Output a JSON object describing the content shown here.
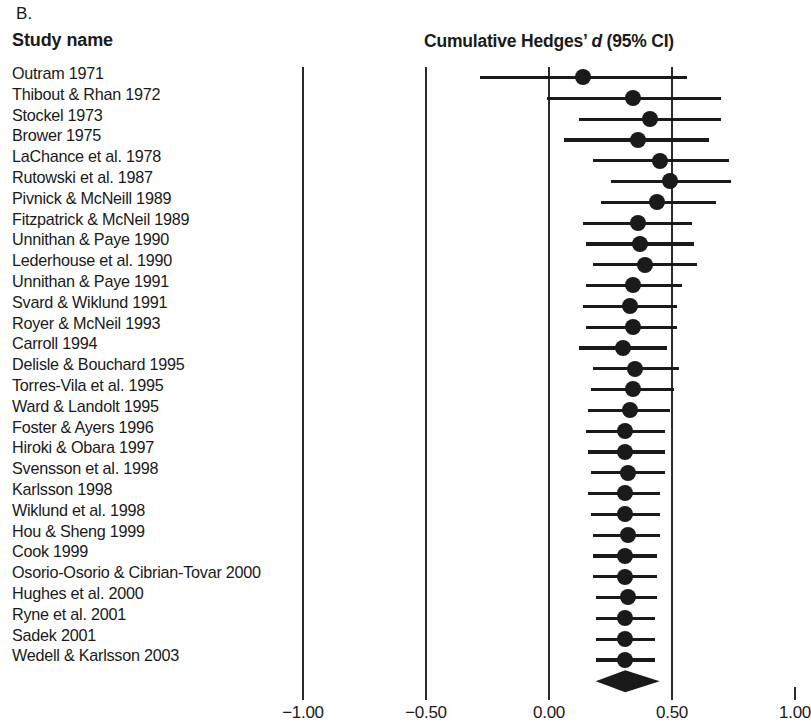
{
  "panel_label": "B.",
  "study_name_header": "Study name",
  "plot_title": {
    "prefix": "Cumulative Hedges’ ",
    "italic": "d",
    "suffix": " (95% CI)"
  },
  "axis": {
    "ticks": [
      "−1.00",
      "−0.50",
      "0.00",
      "0.50",
      "1.00"
    ],
    "tick_values": [
      -1.0,
      -0.5,
      0.0,
      0.5,
      1.0
    ],
    "gridline_values": [
      -1.0,
      -0.5,
      0.0,
      0.5
    ]
  },
  "chart_data": {
    "type": "forest",
    "title": "Cumulative Hedges’ d (95% CI)",
    "xlabel": "",
    "ylabel": "Study name",
    "xlim": [
      -1.2,
      1.05
    ],
    "grid": true,
    "legend": "none",
    "categories": [
      "Outram 1971",
      "Thibout & Rhan 1972",
      "Stockel 1973",
      "Brower 1975",
      "LaChance et al. 1978",
      "Rutowski et al. 1987",
      "Pivnick & McNeill 1989",
      "Fitzpatrick & McNeil 1989",
      "Unnithan & Paye 1990",
      "Lederhouse et al. 1990",
      "Unnithan & Paye 1991",
      "Svard & Wiklund 1991",
      "Royer & McNeil 1993",
      "Carroll 1994",
      "Delisle & Bouchard 1995",
      "Torres-Vila et al. 1995",
      "Ward & Landolt 1995",
      "Foster & Ayers 1996",
      "Hiroki & Obara 1997",
      "Svensson et al. 1998",
      "Karlsson 1998",
      "Wiklund et al. 1998",
      "Hou & Sheng 1999",
      "Cook 1999",
      "Osorio-Osorio & Cibrian-Tovar 2000",
      "Hughes et al. 2000",
      "Ryne et al. 2001",
      "Sadek 2001",
      "Wedell & Karlsson 2003"
    ],
    "points": [
      {
        "study": "Outram 1971",
        "d": 0.14,
        "ci_low": -0.28,
        "ci_high": 0.56
      },
      {
        "study": "Thibout & Rhan 1972",
        "d": 0.34,
        "ci_low": -0.01,
        "ci_high": 0.7
      },
      {
        "study": "Stockel 1973",
        "d": 0.41,
        "ci_low": 0.12,
        "ci_high": 0.7
      },
      {
        "study": "Brower 1975",
        "d": 0.36,
        "ci_low": 0.06,
        "ci_high": 0.65
      },
      {
        "study": "LaChance et al. 1978",
        "d": 0.45,
        "ci_low": 0.18,
        "ci_high": 0.73
      },
      {
        "study": "Rutowski et al. 1987",
        "d": 0.49,
        "ci_low": 0.25,
        "ci_high": 0.74
      },
      {
        "study": "Pivnick & McNeill 1989",
        "d": 0.44,
        "ci_low": 0.21,
        "ci_high": 0.68
      },
      {
        "study": "Fitzpatrick & McNeil 1989",
        "d": 0.36,
        "ci_low": 0.14,
        "ci_high": 0.58
      },
      {
        "study": "Unnithan & Paye 1990",
        "d": 0.37,
        "ci_low": 0.15,
        "ci_high": 0.59
      },
      {
        "study": "Lederhouse et al. 1990",
        "d": 0.39,
        "ci_low": 0.18,
        "ci_high": 0.6
      },
      {
        "study": "Unnithan & Paye 1991",
        "d": 0.34,
        "ci_low": 0.15,
        "ci_high": 0.54
      },
      {
        "study": "Svard & Wiklund 1991",
        "d": 0.33,
        "ci_low": 0.14,
        "ci_high": 0.52
      },
      {
        "study": "Royer & McNeil 1993",
        "d": 0.34,
        "ci_low": 0.15,
        "ci_high": 0.52
      },
      {
        "study": "Carroll 1994",
        "d": 0.3,
        "ci_low": 0.12,
        "ci_high": 0.48
      },
      {
        "study": "Delisle & Bouchard 1995",
        "d": 0.35,
        "ci_low": 0.18,
        "ci_high": 0.53
      },
      {
        "study": "Torres-Vila et al. 1995",
        "d": 0.34,
        "ci_low": 0.17,
        "ci_high": 0.51
      },
      {
        "study": "Ward & Landolt 1995",
        "d": 0.33,
        "ci_low": 0.16,
        "ci_high": 0.49
      },
      {
        "study": "Foster & Ayers 1996",
        "d": 0.31,
        "ci_low": 0.15,
        "ci_high": 0.47
      },
      {
        "study": "Hiroki & Obara 1997",
        "d": 0.31,
        "ci_low": 0.16,
        "ci_high": 0.47
      },
      {
        "study": "Svensson et al. 1998",
        "d": 0.32,
        "ci_low": 0.17,
        "ci_high": 0.47
      },
      {
        "study": "Karlsson 1998",
        "d": 0.31,
        "ci_low": 0.16,
        "ci_high": 0.45
      },
      {
        "study": "Wiklund et al. 1998",
        "d": 0.31,
        "ci_low": 0.17,
        "ci_high": 0.45
      },
      {
        "study": "Hou & Sheng 1999",
        "d": 0.32,
        "ci_low": 0.18,
        "ci_high": 0.45
      },
      {
        "study": "Cook 1999",
        "d": 0.31,
        "ci_low": 0.18,
        "ci_high": 0.44
      },
      {
        "study": "Osorio-Osorio & Cibrian-Tovar 2000",
        "d": 0.31,
        "ci_low": 0.18,
        "ci_high": 0.44
      },
      {
        "study": "Hughes et al. 2000",
        "d": 0.32,
        "ci_low": 0.19,
        "ci_high": 0.44
      },
      {
        "study": "Ryne et al. 2001",
        "d": 0.31,
        "ci_low": 0.19,
        "ci_high": 0.43
      },
      {
        "study": "Sadek 2001",
        "d": 0.31,
        "ci_low": 0.19,
        "ci_high": 0.43
      },
      {
        "study": "Wedell & Karlsson 2003",
        "d": 0.31,
        "ci_low": 0.19,
        "ci_high": 0.43
      }
    ],
    "summary": {
      "label": "",
      "d": 0.31,
      "ci_low": 0.19,
      "ci_high": 0.45,
      "marker": "diamond"
    }
  }
}
